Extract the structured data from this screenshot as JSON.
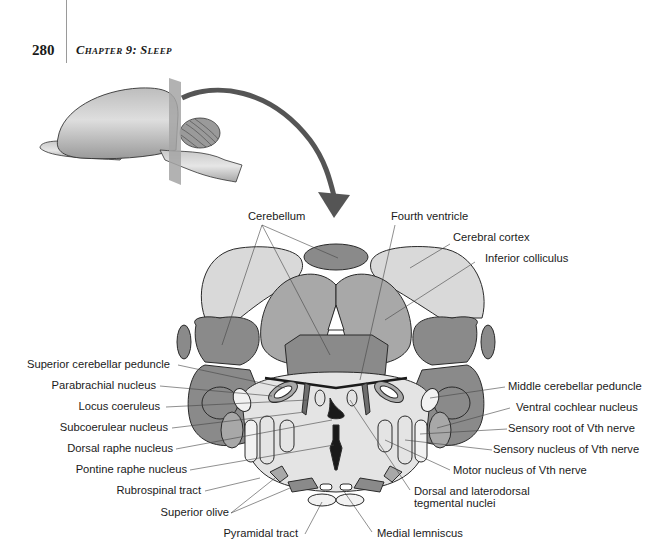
{
  "header": {
    "page_number": "280",
    "running_head": "Chapter 9: Sleep"
  },
  "figure": {
    "top_labels": {
      "cerebellum": "Cerebellum",
      "fourth_ventricle": "Fourth ventricle",
      "cerebral_cortex": "Cerebral cortex",
      "inferior_colliculus": "Inferior colliculus"
    },
    "left_labels": [
      "Superior cerebellar peduncle",
      "Parabrachial nucleus",
      "Locus coeruleus",
      "Subcoerulear nucleus",
      "Dorsal raphe nucleus",
      "Pontine raphe nucleus",
      "Rubrospinal tract",
      "Superior olive",
      "Pyramidal tract"
    ],
    "right_labels": [
      "Middle cerebellar peduncle",
      "Ventral cochlear nucleus",
      "Sensory root of Vth nerve",
      "Sensory nucleus of Vth nerve",
      "Motor nucleus of Vth nerve",
      "Dorsal and laterodorsal",
      "tegmental nuclei",
      "Medial lemniscus"
    ],
    "colors": {
      "light_gray": "#d9d9d9",
      "mid_gray": "#a8a8a8",
      "dark_gray": "#8a8a8a",
      "darker_gray": "#6e6e6e",
      "pale": "#ececec",
      "black": "#1a1a1a",
      "arrow": "#555555"
    }
  }
}
